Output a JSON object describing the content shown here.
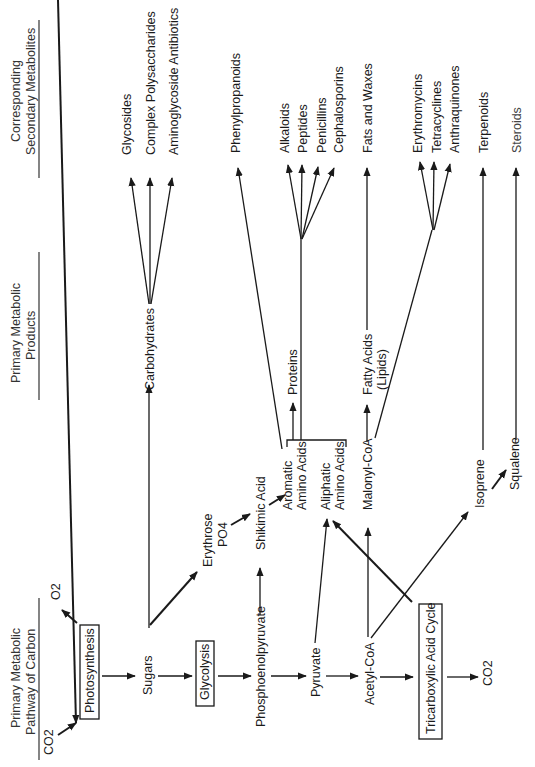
{
  "headers": {
    "primary_pathway": [
      "Primary Metabolic",
      "Pathway of Carbon"
    ],
    "primary_products": [
      "Primary Metabolic",
      "Products"
    ],
    "secondary_metabolites": [
      "Corresponding",
      "Secondary Metabolites"
    ]
  },
  "pathway": {
    "co2_in": "CO2",
    "o2_out": "O2",
    "photosynthesis": "Photosynthesis",
    "sugars": "Sugars",
    "glycolysis": "Glycolysis",
    "phosphoenolpyruvate": "Phosphoenolpyruvate",
    "pyruvate": "Pyruvate",
    "acetyl_coa": "Acetyl-CoA",
    "tca_cycle": "Tricarboxylic Acid Cycle",
    "co2_out": "CO2"
  },
  "intermediates": {
    "erythrose": [
      "Erythrose",
      "PO4"
    ],
    "shikimic_acid": "Shikimic Acid",
    "aromatic_amino_acids": [
      "Aromatic",
      "Amino Acids"
    ],
    "aliphatic_amino_acids": [
      "Aliphatic",
      "Amino Acids"
    ],
    "malonyl_coa": "Malonyl-CoA",
    "isoprene": "Isoprene",
    "squalene": "Squalene"
  },
  "products": {
    "carbohydrates": "Carbohydrates",
    "proteins": "Proteins",
    "fatty_acids": [
      "Fatty Acids",
      "(Lipids)"
    ]
  },
  "secondary": {
    "carbohydrate_derived": [
      "Glycosides",
      "Complex Polysaccharides",
      "Aminoglycoside Antibiotics"
    ],
    "phenylpropanoids": "Phenylpropanoids",
    "amino_acid_derived": [
      "Alkaloids",
      "Peptides",
      "Penicillins",
      "Cephalosporins"
    ],
    "fats_and_waxes": "Fats and Waxes",
    "polyketides": [
      "Erythromycins",
      "Tetracyclines",
      "Anthraquinones"
    ],
    "terpenoids": "Terpenoids",
    "steroids": "Steroids"
  }
}
